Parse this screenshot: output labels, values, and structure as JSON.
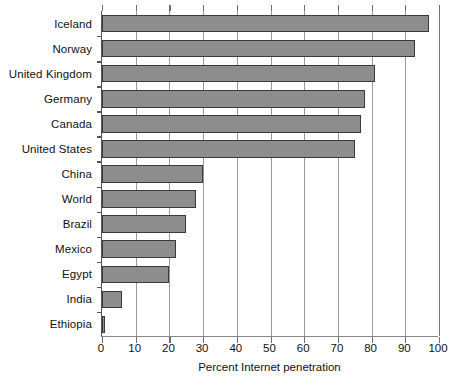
{
  "chart_data": {
    "type": "bar",
    "orientation": "horizontal",
    "title": "",
    "xlabel": "Percent Internet penetration",
    "ylabel": "",
    "xlim": [
      0,
      100
    ],
    "xticks": [
      0,
      10,
      20,
      30,
      40,
      50,
      60,
      70,
      80,
      90,
      100
    ],
    "grid": "vertical",
    "legend": "none",
    "bar_color": "#8d8d8d",
    "bar_edge_color": "#3a3a3a",
    "categories": [
      "Iceland",
      "Norway",
      "United Kingdom",
      "Germany",
      "Canada",
      "United States",
      "China",
      "World",
      "Brazil",
      "Mexico",
      "Egypt",
      "India",
      "Ethiopia"
    ],
    "values": [
      97,
      93,
      81,
      78,
      77,
      75,
      30,
      28,
      25,
      22,
      20,
      6,
      1
    ]
  }
}
